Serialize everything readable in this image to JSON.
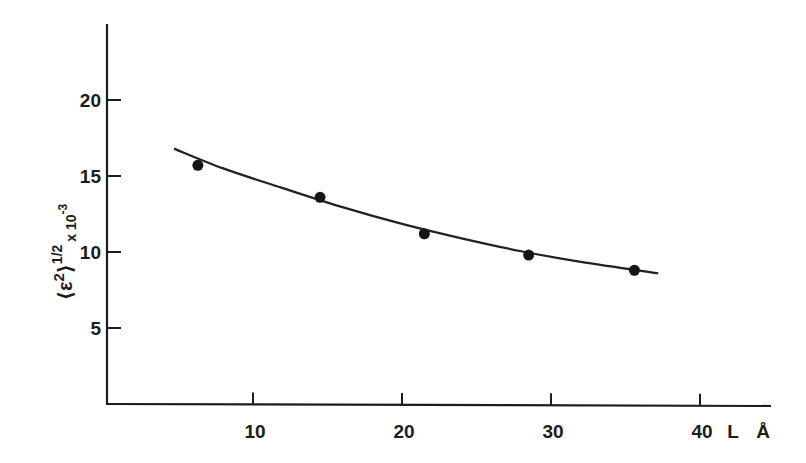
{
  "chart_data": {
    "type": "scatter",
    "title": "",
    "xlabel": "L Å",
    "xlabel_parts": {
      "symbol": "L",
      "unit": "Å"
    },
    "ylabel": "⟨ε²⟩^(1/2) x 10^-3",
    "ylabel_parts": {
      "open": "⟨ε",
      "sup2": "2",
      "close": "⟩",
      "exp": "1/2",
      "mult": "x 10",
      "exp10": "-3"
    },
    "xlim": [
      0,
      44
    ],
    "ylim": [
      0,
      25
    ],
    "x_ticks": [
      10,
      20,
      30,
      40
    ],
    "x_tick_labels": [
      "10",
      "20",
      "30",
      "40"
    ],
    "y_ticks": [
      5,
      10,
      15,
      20
    ],
    "y_tick_labels": [
      "5",
      "10",
      "15",
      "20"
    ],
    "grid": false,
    "legend": null,
    "series": [
      {
        "name": "measured",
        "marker": "filled-circle",
        "x": [
          6.3,
          14.5,
          21.5,
          28.5,
          35.6
        ],
        "y": [
          15.7,
          13.6,
          11.2,
          9.8,
          8.8
        ]
      },
      {
        "name": "fitted curve",
        "style": "solid-line",
        "x": [
          4.7,
          8,
          12,
          16,
          20,
          24,
          28,
          32,
          37.2
        ],
        "y": [
          16.8,
          15.5,
          14.2,
          12.95,
          11.85,
          10.9,
          10.05,
          9.35,
          8.6
        ]
      }
    ]
  }
}
